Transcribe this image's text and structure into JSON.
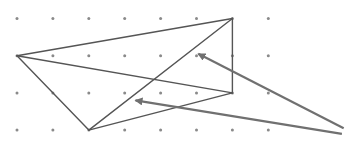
{
  "diagram": {
    "type": "dot-grid-geometry",
    "grid": {
      "columns": 8,
      "rows": 4,
      "dot_color": "#8a8a8a"
    },
    "polygon": {
      "description": "quadrilateral with a diagonal drawn on a dot grid",
      "stroke_color": "#555555",
      "vertices_grid": [
        [
          0,
          1
        ],
        [
          6,
          0
        ],
        [
          6,
          2
        ],
        [
          2,
          3
        ]
      ],
      "edges": [
        {
          "from": [
            0,
            1
          ],
          "to": [
            6,
            0
          ]
        },
        {
          "from": [
            6,
            0
          ],
          "to": [
            6,
            2
          ]
        },
        {
          "from": [
            6,
            2
          ],
          "to": [
            0,
            1
          ]
        },
        {
          "from": [
            0,
            1
          ],
          "to": [
            2,
            3
          ]
        },
        {
          "from": [
            2,
            3
          ],
          "to": [
            6,
            0
          ]
        },
        {
          "from": [
            2,
            3
          ],
          "to": [
            6,
            2
          ]
        }
      ]
    },
    "arrows": [
      {
        "name": "arrow-upper",
        "color": "#707070",
        "tail": [
          9.1,
          2.95
        ],
        "head": [
          5.05,
          0.95
        ]
      },
      {
        "name": "arrow-lower",
        "color": "#707070",
        "tail": [
          9.05,
          3.1
        ],
        "head": [
          3.3,
          2.2
        ]
      }
    ]
  }
}
